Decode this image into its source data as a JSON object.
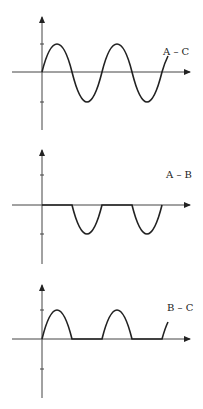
{
  "diagram": {
    "title": "",
    "panels": [
      {
        "label": "A – C",
        "waveform": "full sine wave",
        "y_ticks": [
          "+",
          "-"
        ]
      },
      {
        "label": "A – B",
        "waveform": "negative half-cycles only (positive clipped to zero)",
        "y_ticks": [
          "+",
          "-"
        ]
      },
      {
        "label": "B – C",
        "waveform": "positive half-cycles only (negative clipped to zero)",
        "y_ticks": [
          "+",
          "-"
        ]
      }
    ],
    "colors": {
      "line": "#222222",
      "axis": "#444444",
      "background": "#ffffff"
    }
  }
}
